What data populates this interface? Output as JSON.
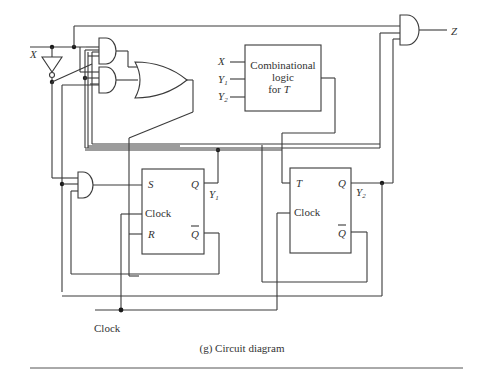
{
  "figure": {
    "caption": "(g)  Circuit diagram",
    "inputs": {
      "x_label": "X",
      "clock_label": "Clock"
    },
    "output": {
      "z_label": "Z"
    },
    "comb_block": {
      "line1": "Combinational",
      "line2": "logic",
      "line3": "for T",
      "in_x": "X",
      "in_y1": "Y",
      "in_y1_sub": "1",
      "in_y2": "Y",
      "in_y2_sub": "2"
    },
    "sr_flipflop": {
      "s": "S",
      "clock": "Clock",
      "r": "R",
      "q": "Q",
      "qbar": "Q",
      "out_label": "Y",
      "out_sub": "1"
    },
    "t_flipflop": {
      "t": "T",
      "clock": "Clock",
      "q": "Q",
      "qbar": "Q",
      "out_label": "Y",
      "out_sub": "2"
    }
  },
  "colors": {
    "line": "#3a3a3a",
    "text": "#333333",
    "background": "#ffffff"
  }
}
